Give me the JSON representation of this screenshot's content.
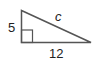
{
  "diagram": {
    "type": "right-triangle",
    "labels": {
      "vertical_leg": "5",
      "horizontal_leg": "12",
      "hypotenuse": "c"
    },
    "colors": {
      "stroke": "#555555",
      "text": "#222222",
      "background": "#ffffff"
    }
  }
}
